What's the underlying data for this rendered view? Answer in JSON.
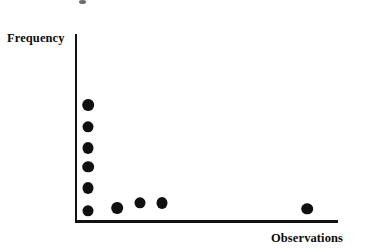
{
  "figure": {
    "axes": {
      "ylabel": "Frequency",
      "xlabel": "Observations"
    }
  },
  "chart_data": {
    "type": "scatter",
    "title": "",
    "xlabel": "Observations",
    "ylabel": "Frequency",
    "grid": false,
    "legend": null,
    "axis_style": "L-shaped open axes, no tick marks, no tick labels",
    "xlim": [
      0,
      100
    ],
    "ylim": [
      0,
      100
    ],
    "marker": {
      "shape": "filled-circle",
      "color": "#101010",
      "size_px": 11
    },
    "points": [
      {
        "x": 4.5,
        "y": 59.5,
        "px": 88,
        "py": 105,
        "group": "left-stack"
      },
      {
        "x": 4.5,
        "y": 48.0,
        "px": 88,
        "py": 127,
        "group": "left-stack"
      },
      {
        "x": 4.5,
        "y": 37.0,
        "px": 88,
        "py": 148,
        "group": "left-stack"
      },
      {
        "x": 4.5,
        "y": 27.5,
        "px": 88,
        "py": 167,
        "group": "left-stack"
      },
      {
        "x": 4.5,
        "y": 16.5,
        "px": 88,
        "py": 188,
        "group": "left-stack"
      },
      {
        "x": 4.5,
        "y": 4.5,
        "px": 88,
        "py": 211,
        "group": "left-stack"
      },
      {
        "x": 16.0,
        "y": 6.0,
        "px": 117,
        "py": 208,
        "group": "low-cluster"
      },
      {
        "x": 24.5,
        "y": 8.5,
        "px": 140,
        "py": 203,
        "group": "low-cluster"
      },
      {
        "x": 33.0,
        "y": 8.5,
        "px": 162,
        "py": 203,
        "group": "low-cluster"
      },
      {
        "x": 88.5,
        "y": 5.5,
        "px": 307,
        "py": 209,
        "group": "outlier"
      }
    ]
  }
}
